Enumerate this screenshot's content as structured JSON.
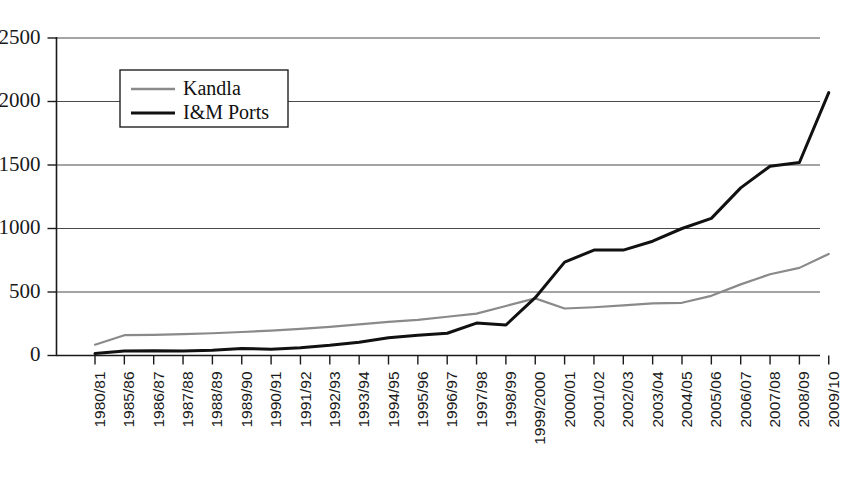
{
  "chart_data": {
    "type": "line",
    "title": "",
    "xlabel": "",
    "ylabel": "",
    "ylim": [
      0,
      2500
    ],
    "yticks": [
      0,
      500,
      1000,
      1500,
      2000,
      2500
    ],
    "grid": true,
    "legend_position": "top-left",
    "categories": [
      "1980/81",
      "1985/86",
      "1986/87",
      "1987/88",
      "1988/89",
      "1989/90",
      "1990/91",
      "1991/92",
      "1992/93",
      "1993/94",
      "1994/95",
      "1995/96",
      "1996/97",
      "1997/98",
      "1998/99",
      "1999/2000",
      "2000/01",
      "2001/02",
      "2002/03",
      "2003/04",
      "2004/05",
      "2005/06",
      "2006/07",
      "2007/08",
      "2008/09",
      "2009/10"
    ],
    "series": [
      {
        "name": "Kandla",
        "color": "#8a8a8a",
        "values": [
          85,
          160,
          163,
          168,
          175,
          185,
          196,
          210,
          225,
          245,
          265,
          280,
          305,
          330,
          390,
          450,
          370,
          380,
          395,
          410,
          415,
          470,
          560,
          640,
          690,
          800
        ]
      },
      {
        "name": "I&M Ports",
        "color": "#111111",
        "values": [
          15,
          35,
          38,
          35,
          42,
          55,
          50,
          62,
          80,
          105,
          140,
          160,
          175,
          255,
          240,
          455,
          735,
          830,
          830,
          900,
          1000,
          1080,
          1320,
          1490,
          1520,
          2070
        ]
      }
    ],
    "y_tick_labels": [
      "0",
      "500",
      "1000",
      "1500",
      "2000",
      "2500"
    ]
  },
  "legend": {
    "entries": [
      {
        "label": "Kandla"
      },
      {
        "label": "I&M Ports"
      }
    ]
  }
}
